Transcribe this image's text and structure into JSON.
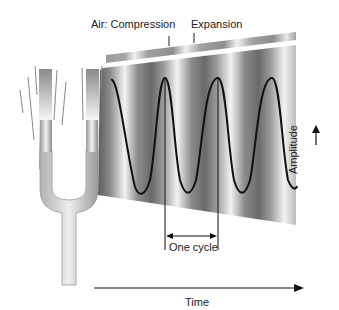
{
  "labels": {
    "compression": "Air: Compression",
    "expansion": "Expansion",
    "amplitude": "Amplitude",
    "one_cycle": "One cycle",
    "time": "Time"
  },
  "colors": {
    "wave_dark": "#6e6e6e",
    "wave_light": "#f4f4f4",
    "band": "#9a9a9a",
    "line": "#111111"
  }
}
